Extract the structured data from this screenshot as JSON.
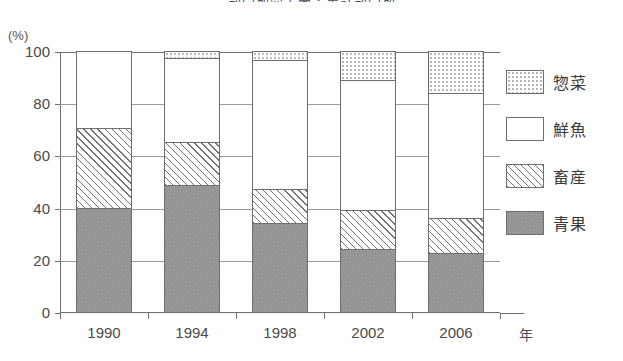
{
  "title": "部門別売上高・集計部門別",
  "axis": {
    "y_unit": "(%)",
    "x_unit": "年",
    "y_ticks": [
      "100",
      "80",
      "60",
      "40",
      "20",
      "0"
    ]
  },
  "legend": {
    "items": [
      {
        "label": "惣菜",
        "swatch": "dotted-swatch"
      },
      {
        "label": "鮮魚",
        "swatch": "white-swatch"
      },
      {
        "label": "畜産",
        "swatch": "hatched-swatch"
      },
      {
        "label": "青果",
        "swatch": "grey-swatch"
      }
    ]
  },
  "chart_data": {
    "type": "bar",
    "stacked": true,
    "stack_total": 100,
    "title": "部門別売上高・集計部門別",
    "xlabel": "年",
    "ylabel": "(%)",
    "ylim": [
      0,
      100
    ],
    "ytick_step": 20,
    "grid": true,
    "legend_position": "right",
    "categories": [
      "1990",
      "1994",
      "1998",
      "2002",
      "2006"
    ],
    "series": [
      {
        "name": "青果",
        "pattern": "solid-grey",
        "values": [
          40.0,
          48.5,
          34.0,
          24.0,
          22.5
        ]
      },
      {
        "name": "畜産",
        "pattern": "diagonal-hatch",
        "values": [
          30.5,
          16.5,
          13.0,
          15.0,
          13.5
        ]
      },
      {
        "name": "鮮魚",
        "pattern": "white",
        "values": [
          29.5,
          32.5,
          49.5,
          50.0,
          48.0
        ]
      },
      {
        "name": "惣菜",
        "pattern": "dotted",
        "values": [
          0.0,
          2.5,
          3.5,
          11.0,
          16.0
        ]
      }
    ],
    "cumulative_tops": {
      "1990": {
        "青果": 40.0,
        "畜産": 70.5,
        "鮮魚": 100.0,
        "惣菜": 100.0
      },
      "1994": {
        "青果": 48.5,
        "畜産": 65.0,
        "鮮魚": 97.5,
        "惣菜": 100.0
      },
      "1998": {
        "青果": 34.0,
        "畜産": 47.0,
        "鮮魚": 96.5,
        "惣菜": 100.0
      },
      "2002": {
        "青果": 24.0,
        "畜産": 39.0,
        "鮮魚": 89.0,
        "惣菜": 100.0
      },
      "2006": {
        "青果": 22.5,
        "畜産": 36.0,
        "鮮魚": 84.0,
        "惣菜": 100.0
      }
    }
  }
}
